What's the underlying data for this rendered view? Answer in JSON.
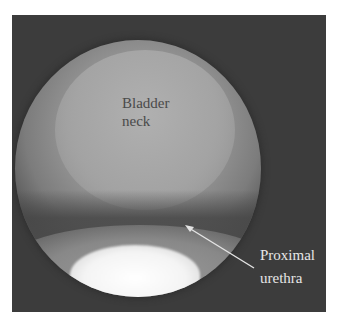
{
  "image": {
    "type": "endoscopic view",
    "background_color": "#3c3c3c",
    "highlight_color": "#ffffff"
  },
  "annotations": {
    "bladder_neck": {
      "line1": "Bladder",
      "line2": "neck"
    },
    "proximal_urethra": {
      "line1": "Proximal",
      "line2": "urethra",
      "arrow_icon": "arrow-icon"
    }
  }
}
